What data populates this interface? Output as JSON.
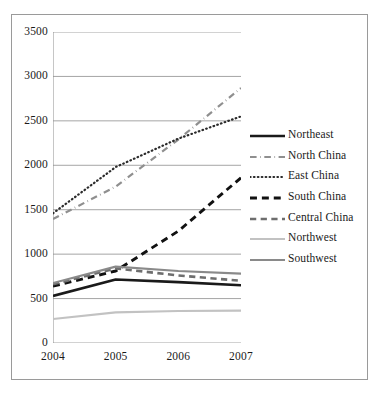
{
  "chart_data": {
    "type": "line",
    "title": "",
    "xlabel": "",
    "ylabel": "",
    "categories": [
      "2004",
      "2005",
      "2006",
      "2007"
    ],
    "x": [
      2004,
      2005,
      2006,
      2007
    ],
    "ylim": [
      0,
      3500
    ],
    "yticks": [
      0,
      500,
      1000,
      1500,
      2000,
      2500,
      3000,
      3500
    ],
    "ytick_labels": [
      "0",
      "500",
      "1000",
      "1500",
      "2000",
      "2500",
      "3000",
      "3500"
    ],
    "grid": true,
    "legend_position": "right",
    "series": [
      {
        "name": "Northeast",
        "values": [
          530,
          715,
          685,
          650
        ],
        "color": "#1a1a1a",
        "style": "solid",
        "width": 2.6
      },
      {
        "name": "North China",
        "values": [
          1395,
          1760,
          2290,
          2870
        ],
        "color": "#8f8f8f",
        "style": "dashdot",
        "width": 2.2
      },
      {
        "name": "East China",
        "values": [
          1460,
          1980,
          2300,
          2550
        ],
        "color": "#2b2b2b",
        "style": "dotted",
        "width": 2.2
      },
      {
        "name": "South China",
        "values": [
          640,
          810,
          1260,
          1860
        ],
        "color": "#111111",
        "style": "dashed",
        "width": 2.9
      },
      {
        "name": "Central China",
        "values": [
          660,
          840,
          760,
          700
        ],
        "color": "#6e6e6e",
        "style": "dashed",
        "width": 2.6
      },
      {
        "name": "Northwest",
        "values": [
          270,
          345,
          360,
          365
        ],
        "color": "#c2c2c2",
        "style": "solid",
        "width": 2.2
      },
      {
        "name": "Southwest",
        "values": [
          675,
          860,
          810,
          780
        ],
        "color": "#8a8a8a",
        "style": "solid",
        "width": 2.2
      }
    ]
  }
}
